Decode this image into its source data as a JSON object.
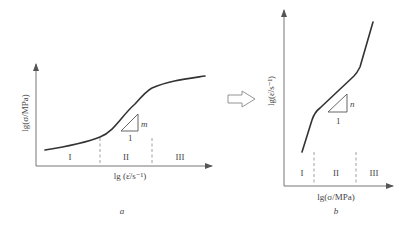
{
  "panel_a": {
    "caption": "a",
    "y_label": "lg(σ/MPa)",
    "x_label": "lg (ε̇/s⁻¹)",
    "regions": [
      "I",
      "II",
      "III"
    ],
    "slope_label": "m",
    "slope_run": "1"
  },
  "transition_arrow": "hollow-right-arrow",
  "panel_b": {
    "caption": "b",
    "y_label": "lg(ε̇/s⁻¹)",
    "x_label": "lg(σ/MPa)",
    "regions": [
      "I",
      "II",
      "III"
    ],
    "slope_label": "n",
    "slope_run": "1"
  },
  "colors": {
    "curve": "#333333",
    "axis": "#777777",
    "text": "#444444"
  }
}
